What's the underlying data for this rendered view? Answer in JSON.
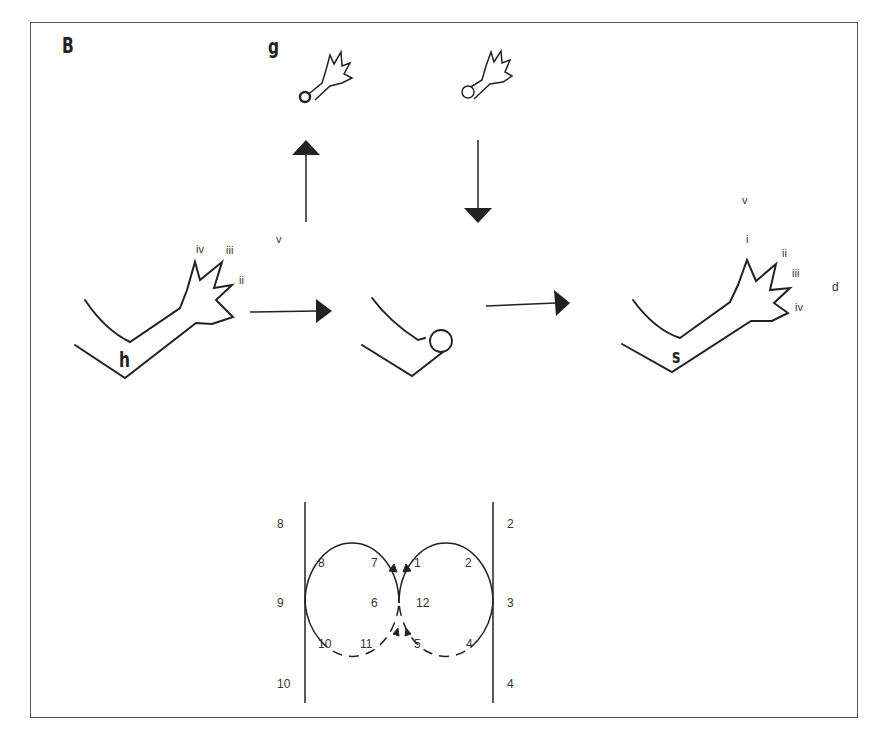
{
  "panel_label": "B",
  "gesture_label": "g",
  "hand_start": {
    "label": "h",
    "finger_labels": [
      "iv",
      "iii",
      "ii"
    ],
    "top_label": "v"
  },
  "hand_end": {
    "label": "s",
    "top_label": "v",
    "finger_labels": [
      "i",
      "ii",
      "iii",
      "iv"
    ],
    "side_label": "d"
  },
  "loop_diagram": {
    "left_outer": [
      "8",
      "9",
      "10"
    ],
    "right_outer": [
      "2",
      "3",
      "4"
    ],
    "left_loop": [
      "8",
      "7",
      "6",
      "10",
      "11"
    ],
    "right_loop": [
      "1",
      "2",
      "12",
      "5",
      "4"
    ]
  }
}
